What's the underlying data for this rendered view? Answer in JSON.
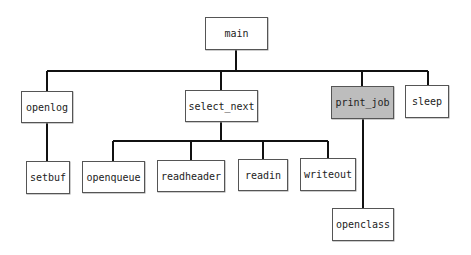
{
  "diagram": {
    "type": "call-tree",
    "root": "main",
    "highlight_color": "#bdbdbd",
    "nodes": {
      "main": {
        "label": "main",
        "x": 205,
        "y": 17,
        "w": 63,
        "h": 33,
        "highlighted": false
      },
      "openlog": {
        "label": "openlog",
        "x": 21,
        "y": 91,
        "w": 52,
        "h": 32,
        "highlighted": false
      },
      "select_next": {
        "label": "select_next",
        "x": 185,
        "y": 90,
        "w": 73,
        "h": 32,
        "highlighted": false
      },
      "print_job": {
        "label": "print_job",
        "x": 331,
        "y": 86,
        "w": 63,
        "h": 33,
        "highlighted": true
      },
      "sleep": {
        "label": "sleep",
        "x": 405,
        "y": 85,
        "w": 44,
        "h": 33,
        "highlighted": false
      },
      "setbuf": {
        "label": "setbuf",
        "x": 26,
        "y": 161,
        "w": 44,
        "h": 33,
        "highlighted": false
      },
      "openqueue": {
        "label": "openqueue",
        "x": 82,
        "y": 161,
        "w": 63,
        "h": 32,
        "highlighted": false
      },
      "readheader": {
        "label": "readheader",
        "x": 157,
        "y": 160,
        "w": 68,
        "h": 32,
        "highlighted": false
      },
      "readin": {
        "label": "readin",
        "x": 238,
        "y": 159,
        "w": 50,
        "h": 32,
        "highlighted": false
      },
      "writeout": {
        "label": "writeout",
        "x": 300,
        "y": 158,
        "w": 56,
        "h": 33,
        "highlighted": false
      },
      "openclass": {
        "label": "openclass",
        "x": 332,
        "y": 208,
        "w": 62,
        "h": 33,
        "highlighted": false
      }
    },
    "edges": [
      [
        "main",
        "openlog"
      ],
      [
        "main",
        "select_next"
      ],
      [
        "main",
        "print_job"
      ],
      [
        "main",
        "sleep"
      ],
      [
        "openlog",
        "setbuf"
      ],
      [
        "select_next",
        "openqueue"
      ],
      [
        "select_next",
        "readheader"
      ],
      [
        "select_next",
        "readin"
      ],
      [
        "select_next",
        "writeout"
      ],
      [
        "print_job",
        "openclass"
      ]
    ]
  }
}
